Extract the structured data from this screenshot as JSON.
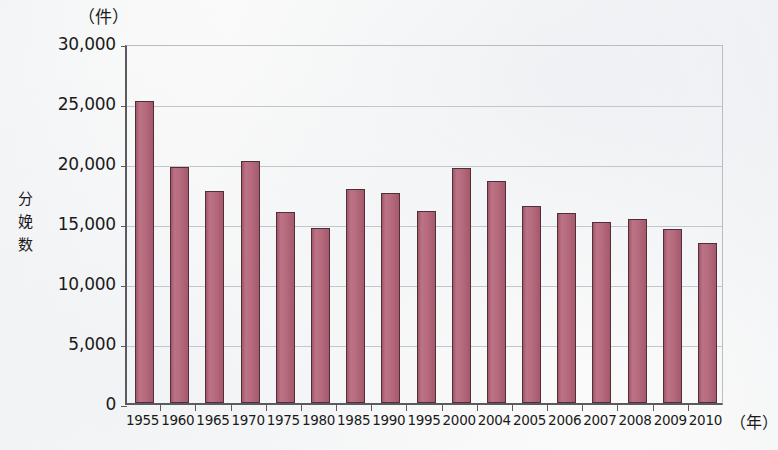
{
  "chart_data": {
    "type": "bar",
    "title": "",
    "subtitle": "",
    "xlabel": "年",
    "ylabel": "分娩数",
    "y_unit_label": "（件）",
    "x_unit_label": "（年）",
    "categories": [
      "1955",
      "1960",
      "1965",
      "1970",
      "1975",
      "1980",
      "1985",
      "1990",
      "1995",
      "2000",
      "2004",
      "2005",
      "2006",
      "2007",
      "2008",
      "2009",
      "2010"
    ],
    "values": [
      25200,
      19700,
      17700,
      20200,
      15900,
      14600,
      17800,
      17500,
      16000,
      19600,
      18500,
      16400,
      15800,
      15100,
      15300,
      14500,
      13300
    ],
    "ylim": [
      0,
      30000
    ],
    "ytick_labels": [
      "30,000",
      "25,000",
      "20,000",
      "15,000",
      "10,000",
      "5,000",
      "0"
    ],
    "ytick_values": [
      30000,
      25000,
      20000,
      15000,
      10000,
      5000,
      0
    ],
    "grid": true,
    "legend": false,
    "bar_color": "#b06a7d",
    "bar_border_color": "#4e3038",
    "axis_color": "#5a5a60",
    "grid_color": "#c3c6cc",
    "background_color": "#fcfcfb"
  },
  "axis": {
    "y_title_chars": "分\n娩\n数"
  }
}
